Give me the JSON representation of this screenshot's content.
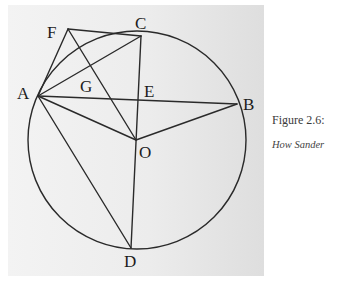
{
  "figure": {
    "caption_title": "Figure 2.6:",
    "caption_subtitle": "How Sander"
  },
  "diagram": {
    "points": {
      "F": {
        "label": "F",
        "x": 68,
        "y": 29
      },
      "C": {
        "label": "C",
        "x": 141,
        "y": 36
      },
      "A": {
        "label": "A",
        "x": 38,
        "y": 96
      },
      "G": {
        "label": "G",
        "x": 93,
        "y": 77
      },
      "E": {
        "label": "E",
        "x": 138,
        "y": 100
      },
      "B": {
        "label": "B",
        "x": 237,
        "y": 104
      },
      "O": {
        "label": "O",
        "x": 136,
        "y": 140
      },
      "D": {
        "label": "D",
        "x": 131,
        "y": 248
      }
    },
    "circle": {
      "cx": 137,
      "cy": 140,
      "r": 109
    },
    "segments": [
      [
        "F",
        "C"
      ],
      [
        "F",
        "A"
      ],
      [
        "F",
        "O"
      ],
      [
        "A",
        "C"
      ],
      [
        "A",
        "B"
      ],
      [
        "A",
        "O"
      ],
      [
        "A",
        "D"
      ],
      [
        "C",
        "D"
      ],
      [
        "O",
        "B"
      ]
    ]
  }
}
